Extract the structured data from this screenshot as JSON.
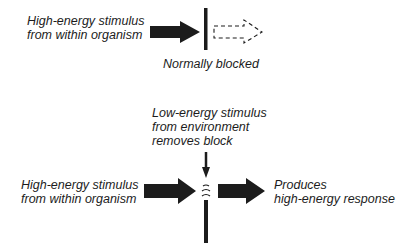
{
  "top_panel": {
    "source_label": [
      "High-energy stimulus",
      "from within organism"
    ],
    "caption": "Normally blocked"
  },
  "bottom_panel": {
    "trigger_label": [
      "Low-energy stimulus",
      "from environment",
      "removes block"
    ],
    "source_label": [
      "High-energy stimulus",
      "from within organism"
    ],
    "result_label": [
      "Produces",
      "high-energy response"
    ]
  },
  "colors": {
    "ink": "#1c1c1c",
    "background": "#ffffff"
  }
}
